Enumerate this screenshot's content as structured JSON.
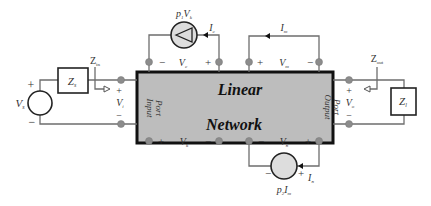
{
  "diagram": {
    "network": {
      "title_line1": "Linear",
      "title_line2": "Network",
      "fill": "#bdbdbd",
      "border": "#111111"
    },
    "ports": {
      "input": {
        "line1": "Input",
        "line2": "Port"
      },
      "output": {
        "line1": "Output",
        "line2": "Port"
      }
    },
    "source": {
      "label": "V",
      "sub": "s",
      "plus": "+",
      "minus": "−"
    },
    "source_impedance": {
      "label": "Z",
      "sub": "s"
    },
    "load_impedance": {
      "label": "Z",
      "sub": "l"
    },
    "z_in": {
      "label": "Z",
      "sub": "in"
    },
    "z_out": {
      "label": "Z",
      "sub": "out"
    },
    "v_input": {
      "label": "V",
      "sub": "i",
      "plus": "+",
      "minus": "−"
    },
    "v_output": {
      "label": "V",
      "sub": "o",
      "plus": "+",
      "minus": "−"
    },
    "top_left_port": {
      "label": "V",
      "sub": "c",
      "minus": "−",
      "plus": "+"
    },
    "top_right_port": {
      "label": "V",
      "sub": "m",
      "plus": "+",
      "minus": "−"
    },
    "bottom_left_port": {
      "label": "V",
      "sub": "k",
      "plus": "+",
      "minus": "−"
    },
    "bottom_right_port": {
      "label": "V",
      "sub": "n",
      "minus": "−",
      "plus": "+"
    },
    "dependent_current_source": {
      "gain_label": "p",
      "gain_sub": "1",
      "ctrl_label": "V",
      "ctrl_sub": "k",
      "current_label": "I",
      "current_sub": "c"
    },
    "current_m": {
      "label": "I",
      "sub": "m"
    },
    "dependent_voltage_source": {
      "gain_label": "p",
      "gain_sub": "2",
      "ctrl_label": "I",
      "ctrl_sub": "m",
      "current_label": "I",
      "current_sub": "n",
      "plus": "+",
      "minus": "−"
    }
  }
}
